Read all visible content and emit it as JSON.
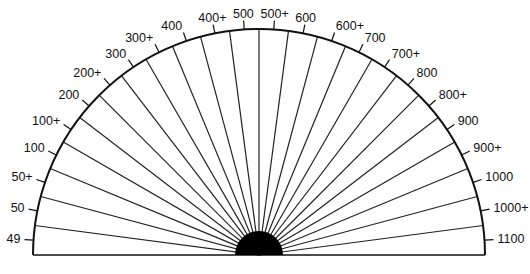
{
  "diagram": {
    "type": "semicircular-scale",
    "center": {
      "x": 259,
      "y": 255
    },
    "radius": 226,
    "hub_radius": 24,
    "stroke_color": "#111111",
    "labels": [
      "49",
      "50",
      "50+",
      "100",
      "100+",
      "200",
      "200+",
      "300",
      "300+",
      "400",
      "400+",
      "500",
      "500+",
      "600",
      "600+",
      "700",
      "700+",
      "800",
      "800+",
      "900",
      "900+",
      "1000",
      "1000+",
      "1100"
    ]
  }
}
